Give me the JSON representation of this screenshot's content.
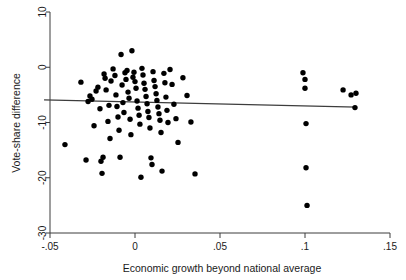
{
  "chart_data": {
    "type": "scatter",
    "title": "",
    "xlabel": "Economic growth beyond national average",
    "ylabel": "Vote-share difference",
    "xlim": [
      -0.055,
      0.155
    ],
    "ylim": [
      -30,
      10
    ],
    "xticks": [
      -0.05,
      0,
      0.05,
      0.1,
      0.15
    ],
    "xtick_labels": [
      "-.05",
      "0",
      ".05",
      ".1",
      ".15"
    ],
    "yticks": [
      10,
      0,
      -10,
      -20,
      -30
    ],
    "ytick_labels": [
      "10",
      "0",
      "-10",
      "-20",
      "-30"
    ],
    "grid": false,
    "legend": null,
    "marker_color": "#000000",
    "line_color": "#3d3d3d",
    "fit_line": {
      "label": "linear fit",
      "x": [
        -0.0535,
        0.1305
      ],
      "y": [
        -5.9,
        -7.2
      ]
    },
    "series": [
      {
        "name": "districts",
        "points": [
          [
            -0.0412,
            -14.0
          ],
          [
            -0.0318,
            -2.7
          ],
          [
            -0.0288,
            -16.8
          ],
          [
            -0.0276,
            -6.2
          ],
          [
            -0.0265,
            -5.2
          ],
          [
            -0.0253,
            -5.8
          ],
          [
            -0.0241,
            -10.6
          ],
          [
            -0.0229,
            -4.3
          ],
          [
            -0.0218,
            -3.6
          ],
          [
            -0.0206,
            -7.5
          ],
          [
            -0.02,
            -17.0
          ],
          [
            -0.0194,
            -19.2
          ],
          [
            -0.0188,
            -16.3
          ],
          [
            -0.0182,
            -1.2
          ],
          [
            -0.0176,
            -2.0
          ],
          [
            -0.017,
            -4.1
          ],
          [
            -0.0159,
            -9.8
          ],
          [
            -0.0153,
            -6.9
          ],
          [
            -0.0147,
            -12.9
          ],
          [
            -0.0141,
            -2.5
          ],
          [
            -0.0129,
            -0.3
          ],
          [
            -0.0118,
            -1.5
          ],
          [
            -0.0112,
            -5.0
          ],
          [
            -0.0106,
            -7.1
          ],
          [
            -0.01,
            -9.0
          ],
          [
            -0.0094,
            -11.4
          ],
          [
            -0.0088,
            -16.3
          ],
          [
            -0.0082,
            2.3
          ],
          [
            -0.0076,
            -3.2
          ],
          [
            -0.0071,
            -6.4
          ],
          [
            -0.0065,
            -8.2
          ],
          [
            -0.0059,
            -1.0
          ],
          [
            -0.0053,
            -2.2
          ],
          [
            -0.0047,
            -0.6
          ],
          [
            -0.0041,
            -4.5
          ],
          [
            -0.0035,
            -5.6
          ],
          [
            -0.0029,
            -9.4
          ],
          [
            -0.0024,
            -12.2
          ],
          [
            -0.0018,
            3.0
          ],
          [
            -0.0012,
            -1.8
          ],
          [
            -0.0006,
            -0.9
          ],
          [
            0.0,
            -2.6
          ],
          [
            0.0006,
            -3.8
          ],
          [
            0.0012,
            -6.1
          ],
          [
            0.0018,
            -7.4
          ],
          [
            0.0024,
            -8.7
          ],
          [
            0.0029,
            -10.3
          ],
          [
            0.0035,
            -19.9
          ],
          [
            0.0041,
            -0.2
          ],
          [
            0.0047,
            -1.4
          ],
          [
            0.0053,
            -2.9
          ],
          [
            0.0059,
            -4.0
          ],
          [
            0.0065,
            -5.3
          ],
          [
            0.0071,
            -6.6
          ],
          [
            0.0076,
            -8.0
          ],
          [
            0.0082,
            -9.1
          ],
          [
            0.0088,
            -11.0
          ],
          [
            0.0094,
            -16.4
          ],
          [
            0.01,
            -17.6
          ],
          [
            0.0106,
            -0.8
          ],
          [
            0.0112,
            -2.4
          ],
          [
            0.0118,
            -3.5
          ],
          [
            0.0124,
            -4.8
          ],
          [
            0.0129,
            -6.0
          ],
          [
            0.0135,
            -7.2
          ],
          [
            0.0141,
            -8.4
          ],
          [
            0.0147,
            -9.6
          ],
          [
            0.0153,
            -11.8
          ],
          [
            0.0159,
            -18.8
          ],
          [
            0.017,
            -1.1
          ],
          [
            0.0176,
            -2.8
          ],
          [
            0.0182,
            -5.4
          ],
          [
            0.0188,
            -7.8
          ],
          [
            0.0194,
            -10.0
          ],
          [
            0.0206,
            -0.4
          ],
          [
            0.0218,
            -3.1
          ],
          [
            0.0229,
            -6.7
          ],
          [
            0.0241,
            -9.3
          ],
          [
            0.0253,
            -13.6
          ],
          [
            0.0282,
            -1.9
          ],
          [
            0.0306,
            -5.1
          ],
          [
            0.0329,
            -9.9
          ],
          [
            0.0353,
            -19.3
          ],
          [
            0.0988,
            -1.0
          ],
          [
            0.1,
            -2.2
          ],
          [
            0.1,
            -3.8
          ],
          [
            0.1006,
            -10.2
          ],
          [
            0.1006,
            -18.2
          ],
          [
            0.1012,
            -25.0
          ],
          [
            0.1224,
            -4.1
          ],
          [
            0.1271,
            -5.0
          ],
          [
            0.1294,
            -7.3
          ],
          [
            0.13,
            -4.7
          ]
        ]
      }
    ]
  },
  "axes": {
    "y_title": "Vote-share difference",
    "x_title": "Economic growth beyond national average"
  }
}
